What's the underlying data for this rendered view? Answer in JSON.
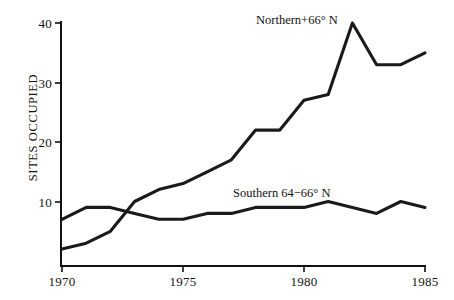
{
  "figure": {
    "background": "#ffffff",
    "ink": "#111111"
  },
  "axes": {
    "y_title": "SITES OCCUPIED",
    "y_ticks": [
      "10",
      "20",
      "30",
      "40"
    ],
    "x_ticks": [
      "1970",
      "1975",
      "1980",
      "1985"
    ]
  },
  "labels": {
    "northern": "Northern+66° N",
    "southern": "Southern 64−66° N"
  },
  "chart_data": {
    "type": "line",
    "title": "",
    "xlabel": "",
    "ylabel": "SITES OCCUPIED",
    "xlim": [
      1970,
      1985
    ],
    "ylim": [
      0,
      41
    ],
    "x": [
      1970,
      1971,
      1972,
      1973,
      1974,
      1975,
      1976,
      1977,
      1978,
      1979,
      1980,
      1981,
      1982,
      1983,
      1984,
      1985
    ],
    "y_ticks": [
      10,
      20,
      30,
      40
    ],
    "x_ticks": [
      1970,
      1975,
      1980,
      1985
    ],
    "grid": false,
    "legend_position": "inline-annotation",
    "series": [
      {
        "name": "Northern+66° N",
        "values": [
          2,
          3,
          5,
          10,
          12,
          13,
          15,
          17,
          22,
          22,
          27,
          28,
          40,
          33,
          33,
          35
        ]
      },
      {
        "name": "Southern 64−66° N",
        "values": [
          7,
          9,
          9,
          8,
          7,
          7,
          8,
          8,
          9,
          9,
          9,
          10,
          9,
          8,
          10,
          9
        ]
      }
    ],
    "annotations": [
      {
        "text": "Northern+66° N",
        "x": 1978.0,
        "y": 39.5
      },
      {
        "text": "Southern 64−66° N",
        "x": 1977.0,
        "y": 12.5
      }
    ]
  }
}
